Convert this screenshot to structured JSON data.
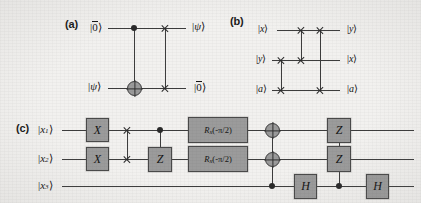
{
  "figure": {
    "background_color": "#f2f1ef",
    "ink_color": "#3d3d3d",
    "gate_fill_color": "#9b9b9b",
    "gate_border_color": "#4a4a4a"
  },
  "panel_a": {
    "label": "(a)",
    "inputs": [
      "|0̄⟩",
      "|ψ⟩"
    ],
    "outputs": [
      "|ψ⟩",
      "|0̄⟩"
    ],
    "input_top_sym": "0",
    "input_top_overline": true,
    "input_bottom_sym": "ψ",
    "output_top_sym": "ψ",
    "output_bottom_sym": "0",
    "output_bottom_overline": true,
    "gates": [
      {
        "name": "cnot",
        "control_wire": 1,
        "target_wire": 2,
        "symbol": "⊕"
      },
      {
        "name": "swap",
        "wire_a": 1,
        "wire_b": 2,
        "symbol": "×"
      }
    ]
  },
  "panel_b": {
    "label": "(b)",
    "inputs": [
      "|x⟩",
      "|y⟩",
      "|a⟩"
    ],
    "outputs": [
      "|y⟩",
      "|x⟩",
      "|a⟩"
    ],
    "input_syms": [
      "x",
      "y",
      "a"
    ],
    "output_syms": [
      "y",
      "x",
      "a"
    ],
    "gates": [
      {
        "name": "swap",
        "wire_a": 2,
        "wire_b": 3,
        "symbol": "×"
      },
      {
        "name": "swap",
        "wire_a": 1,
        "wire_b": 2,
        "symbol": "×"
      },
      {
        "name": "swap",
        "wire_a": 1,
        "wire_b": 3,
        "symbol": "×"
      }
    ]
  },
  "panel_c": {
    "label": "(c)",
    "inputs": [
      "|x₁⟩",
      "|x₂⟩",
      "|x₃⟩"
    ],
    "input_base": "x",
    "input_subscripts": [
      "1",
      "2",
      "3"
    ],
    "gates": {
      "x_gate_wire1": "X",
      "x_gate_wire2": "X",
      "z_gate_controlled": "Z",
      "rot_wire1": "Rₓ(-π/2)",
      "rot_wire2": "Rₓ(-π/2)",
      "rot_base": "R",
      "rot_sub": "x",
      "rot_arg": "(-π/2)",
      "h_gate_first": "H",
      "h_gate_second": "H",
      "z_gate_wire1": "Z",
      "z_gate_wire2": "Z"
    },
    "sequence": [
      {
        "step": 1,
        "type": "single",
        "label": "X",
        "wire": 1
      },
      {
        "step": 1,
        "type": "single",
        "label": "X",
        "wire": 2
      },
      {
        "step": 2,
        "type": "swap",
        "wire_a": 1,
        "wire_b": 2,
        "symbol": "×"
      },
      {
        "step": 3,
        "type": "controlled-gate",
        "label": "Z",
        "control_wire": 1,
        "target_wire": 2
      },
      {
        "step": 4,
        "type": "single",
        "label": "Rₓ(-π/2)",
        "wire": 1
      },
      {
        "step": 4,
        "type": "single",
        "label": "Rₓ(-π/2)",
        "wire": 2
      },
      {
        "step": 5,
        "type": "multi-target-cnot",
        "control_wire": 3,
        "target_wires": [
          1,
          2
        ],
        "symbol": "⊕"
      },
      {
        "step": 6,
        "type": "single",
        "label": "H",
        "wire": 3
      },
      {
        "step": 7,
        "type": "controlled-gate",
        "label": "Z",
        "control_wire": 3,
        "target_wires": [
          1,
          2
        ]
      },
      {
        "step": 8,
        "type": "single",
        "label": "H",
        "wire": 3
      }
    ]
  }
}
